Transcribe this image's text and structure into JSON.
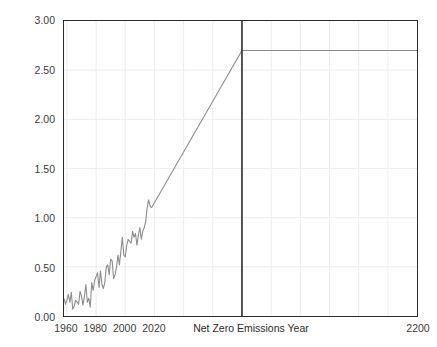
{
  "chart_data": {
    "type": "line",
    "title": "",
    "xlabel": "",
    "ylabel": "Temperature rise, in °C",
    "xlim": [
      1958,
      2200
    ],
    "ylim": [
      0.0,
      3.0
    ],
    "grid": true,
    "legend": "none",
    "y_ticks": [
      "0.00",
      "0.50",
      "1.00",
      "1.50",
      "2.00",
      "2.50",
      "3.00"
    ],
    "y_tick_values": [
      0.0,
      0.5,
      1.0,
      1.5,
      2.0,
      2.5,
      3.0
    ],
    "x_ticks": [
      "1960",
      "1980",
      "2000",
      "2020",
      "2200"
    ],
    "x_tick_values": [
      1960,
      1980,
      2000,
      2020,
      2200
    ],
    "annotations": [
      {
        "name": "net-zero-emissions-year",
        "label": "Net Zero Emissions Year",
        "x": 2080,
        "type": "vertical-line",
        "color": "#2b2b2b"
      }
    ],
    "series": [
      {
        "name": "historical-observed",
        "color": "#8c8c8c",
        "x": [
          1958,
          1959,
          1960,
          1961,
          1962,
          1963,
          1964,
          1965,
          1966,
          1967,
          1968,
          1969,
          1970,
          1971,
          1972,
          1973,
          1974,
          1975,
          1976,
          1977,
          1978,
          1979,
          1980,
          1981,
          1982,
          1983,
          1984,
          1985,
          1986,
          1987,
          1988,
          1989,
          1990,
          1991,
          1992,
          1993,
          1994,
          1995,
          1996,
          1997,
          1998,
          1999,
          2000,
          2001,
          2002,
          2003,
          2004,
          2005,
          2006,
          2007,
          2008,
          2009,
          2010,
          2011,
          2012,
          2013,
          2014,
          2015,
          2016,
          2017,
          2018
        ],
        "values": [
          0.18,
          0.12,
          0.16,
          0.22,
          0.14,
          0.24,
          0.07,
          0.1,
          0.16,
          0.14,
          0.12,
          0.25,
          0.2,
          0.11,
          0.2,
          0.32,
          0.14,
          0.18,
          0.09,
          0.34,
          0.26,
          0.36,
          0.4,
          0.44,
          0.29,
          0.46,
          0.32,
          0.28,
          0.34,
          0.5,
          0.52,
          0.42,
          0.58,
          0.56,
          0.38,
          0.42,
          0.5,
          0.62,
          0.52,
          0.66,
          0.8,
          0.62,
          0.6,
          0.72,
          0.78,
          0.76,
          0.74,
          0.86,
          0.8,
          0.84,
          0.72,
          0.82,
          0.9,
          0.78,
          0.86,
          0.9,
          0.96,
          1.1,
          1.18,
          1.12,
          1.1
        ]
      },
      {
        "name": "projected-ramp",
        "color": "#8c8c8c",
        "x": [
          2018,
          2080
        ],
        "values": [
          1.1,
          2.7
        ]
      },
      {
        "name": "post-net-zero-plateau",
        "color": "#8c8c8c",
        "x": [
          2080,
          2200
        ],
        "values": [
          2.7,
          2.7
        ]
      }
    ],
    "plateau_value": 2.7
  }
}
